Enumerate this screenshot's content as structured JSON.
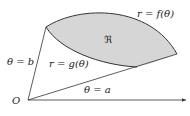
{
  "diagram": {
    "type": "polar-region",
    "labels": {
      "origin": "O",
      "ray_b": "θ = b",
      "ray_a": "θ = a",
      "outer_curve": "r = f(θ)",
      "inner_curve": "r = g(θ)",
      "region": "ℜ"
    },
    "colors": {
      "region_fill": "#d6d6d6",
      "stroke": "#333333"
    }
  }
}
